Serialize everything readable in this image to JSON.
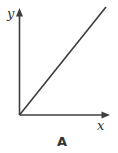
{
  "diagram": {
    "y_axis_label": "y",
    "x_axis_label": "x",
    "caption": "A",
    "colors": {
      "line": "#3f3f3f",
      "text": "#333333",
      "background": "#ffffff"
    }
  }
}
